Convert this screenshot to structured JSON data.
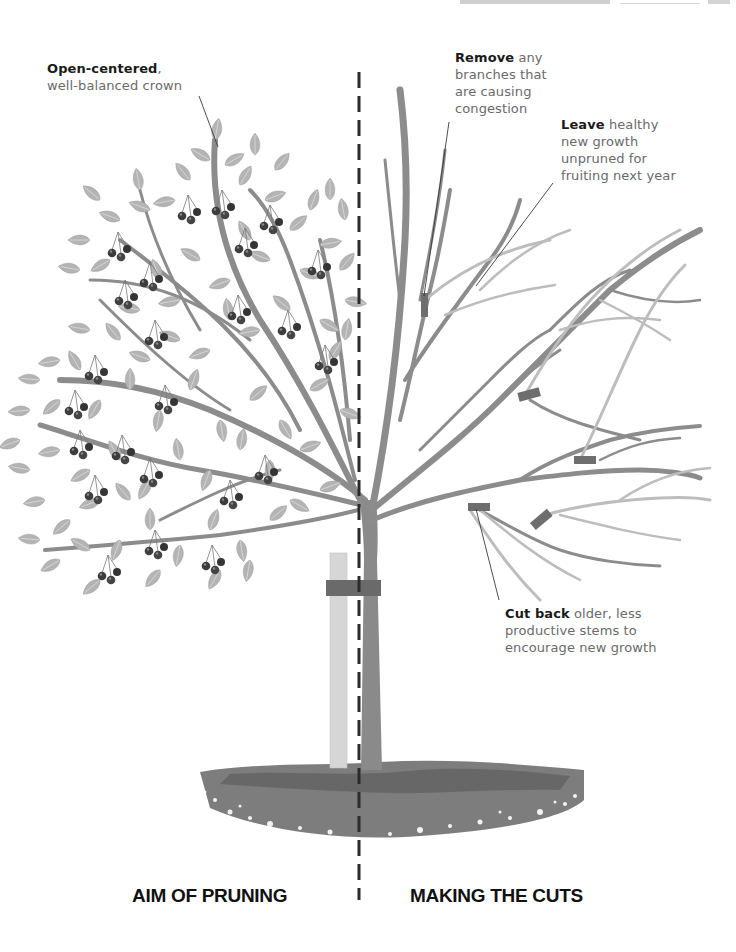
{
  "page": {
    "header_fragment": "(cut off running header at top edge)"
  },
  "divider": {
    "style": "dashed",
    "color": "#2b2b2b"
  },
  "annotations": {
    "open_centered": {
      "bold": "Open-centered",
      "rest_line1": ",",
      "rest_line2": "well-balanced crown"
    },
    "remove": {
      "bold": "Remove",
      "rest": " any branches that are causing congestion",
      "lines": [
        "any",
        "branches that",
        "are causing",
        "congestion"
      ]
    },
    "leave": {
      "bold": "Leave",
      "lines": [
        "healthy",
        "new growth",
        "unpruned for",
        "fruiting next year"
      ]
    },
    "cut_back": {
      "bold": "Cut back",
      "lines": [
        "older, less",
        "productive stems to",
        "encourage new growth"
      ]
    }
  },
  "sections": {
    "left_label": "AIM OF PRUNING",
    "right_label": "MAKING THE CUTS"
  },
  "colors": {
    "trunk": "#8a8a8a",
    "branch": "#8c8c8c",
    "new_growth": "#bdbdbd",
    "cut_mark": "#6e6e6e",
    "leaf": "#b4b4b4",
    "leaf_vein": "#d9d9d9",
    "fruit": "#3d3d3d",
    "stake": "#d6d6d6",
    "tie": "#6a6a6a",
    "soil": "#7d7d7d",
    "soil_dark": "#5e5e5e",
    "text_bold": "#1a1a1a",
    "text_body": "#6a6a6a"
  }
}
